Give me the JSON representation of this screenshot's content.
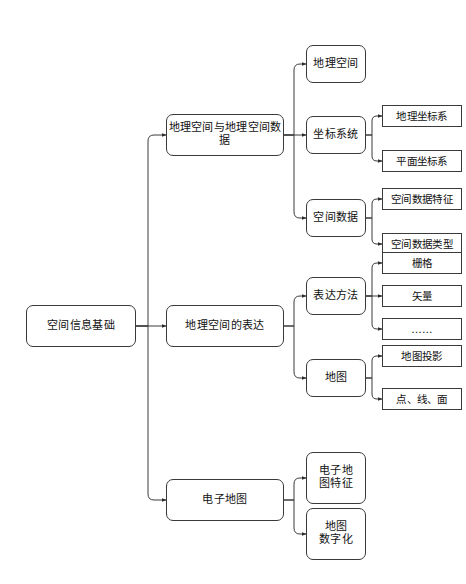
{
  "diagram": {
    "background_color": "#ffffff",
    "line_color": "#3a3a3a",
    "node_fill": "#ffffff",
    "text_color": "#111111"
  },
  "nodes": {
    "root": {
      "label": "空间信息基础"
    },
    "level2": [
      {
        "label": "地理空间与地理空间数据"
      },
      {
        "label": "地理空间的表达"
      },
      {
        "label": "电子地图"
      }
    ],
    "branch1": {
      "children": [
        {
          "label": "地理空间"
        },
        {
          "label": "坐标系统"
        },
        {
          "label": "空间数据"
        }
      ],
      "coord_leaves": [
        {
          "label": "地理坐标系"
        },
        {
          "label": "平面坐标系"
        }
      ],
      "spatial_leaves": [
        {
          "label": "空间数据特征"
        },
        {
          "label": "空间数据类型"
        }
      ]
    },
    "branch2": {
      "children": [
        {
          "label": "表达方法"
        },
        {
          "label": "地图"
        }
      ],
      "method_leaves": [
        {
          "label": "栅格"
        },
        {
          "label": "矢量"
        },
        {
          "label": "……"
        }
      ],
      "map_leaves": [
        {
          "label": "地图投影"
        },
        {
          "label": "点、线、面"
        }
      ]
    },
    "branch3": {
      "children": [
        {
          "label": "电子地\n图特征"
        },
        {
          "label": "地图\n数字化"
        }
      ]
    }
  }
}
